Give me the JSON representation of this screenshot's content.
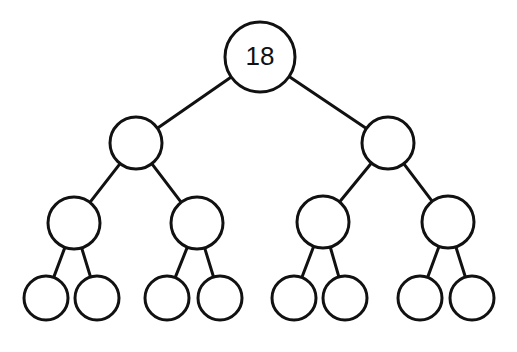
{
  "diagram": {
    "type": "binary-tree",
    "stroke_color": "#111111",
    "fill_color": "#ffffff",
    "stroke_width": 3,
    "nodes": [
      {
        "id": "n0",
        "label": "18",
        "cx": 260,
        "cy": 57,
        "r": 35
      },
      {
        "id": "n1",
        "label": "",
        "cx": 136,
        "cy": 143,
        "r": 26
      },
      {
        "id": "n2",
        "label": "",
        "cx": 388,
        "cy": 143,
        "r": 26
      },
      {
        "id": "n3",
        "label": "",
        "cx": 74,
        "cy": 223,
        "r": 26
      },
      {
        "id": "n4",
        "label": "",
        "cx": 197,
        "cy": 223,
        "r": 26
      },
      {
        "id": "n5",
        "label": "",
        "cx": 323,
        "cy": 222,
        "r": 26
      },
      {
        "id": "n6",
        "label": "",
        "cx": 448,
        "cy": 222,
        "r": 26
      },
      {
        "id": "n7",
        "label": "",
        "cx": 46,
        "cy": 298,
        "r": 22
      },
      {
        "id": "n8",
        "label": "",
        "cx": 97,
        "cy": 298,
        "r": 22
      },
      {
        "id": "n9",
        "label": "",
        "cx": 167,
        "cy": 298,
        "r": 22
      },
      {
        "id": "n10",
        "label": "",
        "cx": 220,
        "cy": 298,
        "r": 22
      },
      {
        "id": "n11",
        "label": "",
        "cx": 294,
        "cy": 298,
        "r": 22
      },
      {
        "id": "n12",
        "label": "",
        "cx": 345,
        "cy": 298,
        "r": 22
      },
      {
        "id": "n13",
        "label": "",
        "cx": 420,
        "cy": 298,
        "r": 22
      },
      {
        "id": "n14",
        "label": "",
        "cx": 472,
        "cy": 298,
        "r": 22
      }
    ],
    "edges": [
      [
        "n0",
        "n1"
      ],
      [
        "n0",
        "n2"
      ],
      [
        "n1",
        "n3"
      ],
      [
        "n1",
        "n4"
      ],
      [
        "n2",
        "n5"
      ],
      [
        "n2",
        "n6"
      ],
      [
        "n3",
        "n7"
      ],
      [
        "n3",
        "n8"
      ],
      [
        "n4",
        "n9"
      ],
      [
        "n4",
        "n10"
      ],
      [
        "n5",
        "n11"
      ],
      [
        "n5",
        "n12"
      ],
      [
        "n6",
        "n13"
      ],
      [
        "n6",
        "n14"
      ]
    ]
  }
}
